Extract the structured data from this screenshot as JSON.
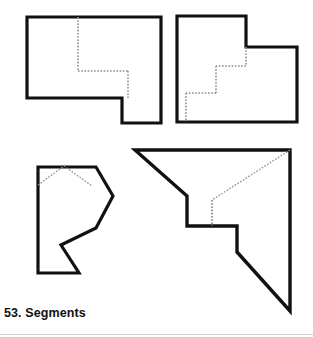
{
  "page": {
    "background_color": "#ffffff",
    "stroke_color": "#111111",
    "dotted_color": "#8c8c8c",
    "caption_text": "53. Segments",
    "caption_number": "53.",
    "caption_label": "Segments",
    "width": 313,
    "height": 337
  },
  "figures": [
    {
      "id": "figure-top-left",
      "name": "rectangle-with-notch",
      "solid_outline": "M27,17 L161,17 L161,123 L122,123 L122,98 L27,98 Z",
      "dotted_segments": [
        "M78,17 L78,71",
        "M78,71 L128,71",
        "M128,71 L128,98"
      ]
    },
    {
      "id": "figure-top-right",
      "name": "stepped-polygon",
      "solid_outline": "M177,16 L246,16 L246,47 L297,47 L297,122 L177,122 Z",
      "dotted_segments": [
        "M246,47 L246,66",
        "M246,66 L216,66",
        "M216,66 L216,93",
        "M216,93 L186,93",
        "M186,93 L186,122"
      ]
    },
    {
      "id": "figure-bottom-left",
      "name": "arrow-notched-polygon",
      "solid_outline": "M38,167 L96,167 L113,196 L96,228 L61,245 L79,273 L38,273 Z",
      "dotted_segments": [
        "M38,185 L64,166 L92,186"
      ]
    },
    {
      "id": "figure-bottom-right",
      "name": "diagonal-stepped-polygon",
      "solid_outline": "M135,150 L290,150 L290,311 L237,252 L237,226 L187,226 L187,196 Z",
      "dotted_segments": [
        "M290,150 L212,200",
        "M212,200 L212,226"
      ]
    }
  ]
}
